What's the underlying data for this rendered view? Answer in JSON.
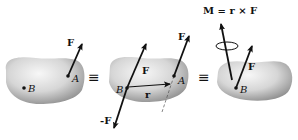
{
  "diagram": {
    "panels": [
      {
        "id": "panel-1",
        "labels": {
          "force": "F",
          "point_a": "A",
          "point_b": "B"
        }
      },
      {
        "id": "panel-2",
        "labels": {
          "force_at_a": "F",
          "force_at_b": "F",
          "neg_force": "-F",
          "position_vector": "r",
          "point_a": "A",
          "point_b": "B"
        }
      },
      {
        "id": "panel-3",
        "labels": {
          "moment_eq": "M = r × F",
          "force": "F",
          "point_b": "B"
        }
      }
    ],
    "equivalence_symbols": [
      "≡",
      "≡"
    ],
    "colors": {
      "body_light": "#f2f2f2",
      "body_dark": "#9a9a9a",
      "vector": "#111111"
    }
  }
}
